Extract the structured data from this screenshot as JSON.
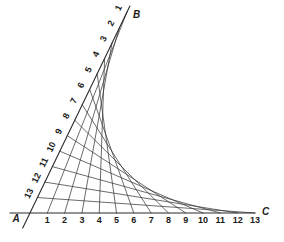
{
  "figure": {
    "type": "envelope-of-lines",
    "background_color": "#ffffff",
    "line_color": "#3a3a3a",
    "axis_color": "#2a2a2a",
    "label_color": "#1a1a1a"
  },
  "vertices": {
    "A": {
      "label": "A",
      "x": 30,
      "y": 213,
      "label_x": 16,
      "label_y": 222
    },
    "B": {
      "label": "B",
      "x": 127,
      "y": 12,
      "label_x": 133,
      "label_y": 18
    },
    "C": {
      "label": "C",
      "x": 255,
      "y": 213,
      "label_x": 262,
      "label_y": 215
    }
  },
  "rays": {
    "AB": {
      "name": "ray-ab",
      "from": "A",
      "to": "B",
      "divisions": 13,
      "label_rotation": -64,
      "tick_labels": [
        "1",
        "2",
        "3",
        "4",
        "5",
        "6",
        "7",
        "8",
        "9",
        "10",
        "11",
        "12",
        "13"
      ],
      "label_order": "1 nearest B, 13 nearest A"
    },
    "AC": {
      "name": "ray-ac",
      "from": "A",
      "to": "C",
      "divisions": 13,
      "label_rotation": 0,
      "tick_labels": [
        "1",
        "2",
        "3",
        "4",
        "5",
        "6",
        "7",
        "8",
        "9",
        "10",
        "11",
        "12",
        "13"
      ],
      "label_order": "1 nearest A, 13 nearest C"
    }
  },
  "chords": {
    "name": "envelope-chords",
    "count": 13,
    "rule": "segment k joins point k on ray AB to point k on ray AC",
    "pairs": [
      [
        1,
        1
      ],
      [
        2,
        2
      ],
      [
        3,
        3
      ],
      [
        4,
        4
      ],
      [
        5,
        5
      ],
      [
        6,
        6
      ],
      [
        7,
        7
      ],
      [
        8,
        8
      ],
      [
        9,
        9
      ],
      [
        10,
        10
      ],
      [
        11,
        11
      ],
      [
        12,
        12
      ],
      [
        13,
        13
      ]
    ]
  },
  "chart_data": {
    "type": "line",
    "title": "",
    "xlabel": "",
    "ylabel": "",
    "axis_a_ticks": [
      1,
      2,
      3,
      4,
      5,
      6,
      7,
      8,
      9,
      10,
      11,
      12,
      13
    ],
    "axis_b_ticks": [
      1,
      2,
      3,
      4,
      5,
      6,
      7,
      8,
      9,
      10,
      11,
      12,
      13
    ],
    "grid": false,
    "legend": "none"
  }
}
